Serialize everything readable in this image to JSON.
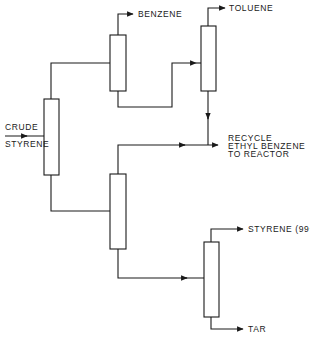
{
  "diagram": {
    "colors": {
      "line": "#1a1a1a",
      "background": "#ffffff"
    },
    "labels": {
      "feed_line1": "CRUDE",
      "feed_line2": "STYRENE",
      "benzene": "BENZENE",
      "toluene": "TOLUENE",
      "recycle_line1": "RECYCLE",
      "recycle_line2": "ETHYL BENZENE",
      "recycle_line3": "TO REACTOR",
      "styrene_product": "STYRENE (99+%)",
      "tar": "TAR"
    },
    "columns": [
      {
        "id": "column-1-crude-feed",
        "x": 44,
        "y": 99,
        "w": 15,
        "h": 76
      },
      {
        "id": "column-2-benzene",
        "x": 110,
        "y": 35,
        "w": 16,
        "h": 56
      },
      {
        "id": "column-3-toluene",
        "x": 201,
        "y": 26,
        "w": 15,
        "h": 65
      },
      {
        "id": "column-4-ethylbenzene",
        "x": 110,
        "y": 174,
        "w": 16,
        "h": 75
      },
      {
        "id": "column-5-styrene",
        "x": 204,
        "y": 242,
        "w": 15,
        "h": 75
      }
    ]
  }
}
